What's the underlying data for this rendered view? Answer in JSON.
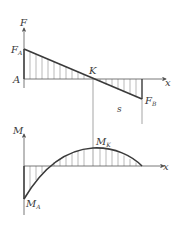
{
  "diagram": {
    "type": "shear-force-and-bending-moment-diagram",
    "shear": {
      "axis_label": "F",
      "x_label": "x",
      "origin_label": "A",
      "start_value_label": "F",
      "start_value_sub": "A",
      "zero_point_label": "K",
      "end_value_label": "F",
      "end_value_sub": "B",
      "segment_label": "s"
    },
    "moment": {
      "axis_label": "M",
      "x_label": "x",
      "peak_label": "M",
      "peak_sub": "K",
      "start_label": "M",
      "start_sub": "A"
    },
    "colors": {
      "line": "#3a3a3a",
      "hatch": "#8a8a8a",
      "thin": "#6a6a6a",
      "background": "#ffffff"
    }
  }
}
